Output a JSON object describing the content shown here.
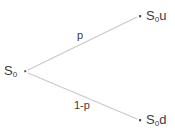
{
  "diagram": {
    "type": "binomial-one-step-tree",
    "canvas": {
      "width": 175,
      "height": 137,
      "background": "#ffffff"
    },
    "colors": {
      "edge": "#c9c9c9",
      "text": "#3b3b3b",
      "node_dot": "#4a4a4a",
      "background": "#ffffff"
    },
    "nodes": [
      {
        "id": "root",
        "name": "initial-state",
        "base": "S",
        "subscript": "0",
        "suffix": "",
        "full_text": "S0",
        "dot": {
          "x": 25,
          "y": 71
        },
        "label_pos": {
          "x": 4,
          "y": 64
        }
      },
      {
        "id": "up",
        "name": "up-state",
        "base": "S",
        "subscript": "0",
        "suffix": "u",
        "full_text": "S0u",
        "dot": {
          "x": 140,
          "y": 16
        },
        "label_pos": {
          "x": 146,
          "y": 9
        }
      },
      {
        "id": "down",
        "name": "down-state",
        "base": "S",
        "subscript": "0",
        "suffix": "d",
        "full_text": "S0d",
        "dot": {
          "x": 140,
          "y": 120
        },
        "label_pos": {
          "x": 146,
          "y": 113
        }
      }
    ],
    "edges": [
      {
        "id": "edge-up",
        "name": "up-branch",
        "from": "root",
        "to": "up",
        "label": "p",
        "x1": 28,
        "y1": 70,
        "x2": 137,
        "y2": 17
      },
      {
        "id": "edge-down",
        "name": "down-branch",
        "from": "root",
        "to": "down",
        "label": "1-p",
        "x1": 28,
        "y1": 73,
        "x2": 137,
        "y2": 119
      }
    ]
  }
}
